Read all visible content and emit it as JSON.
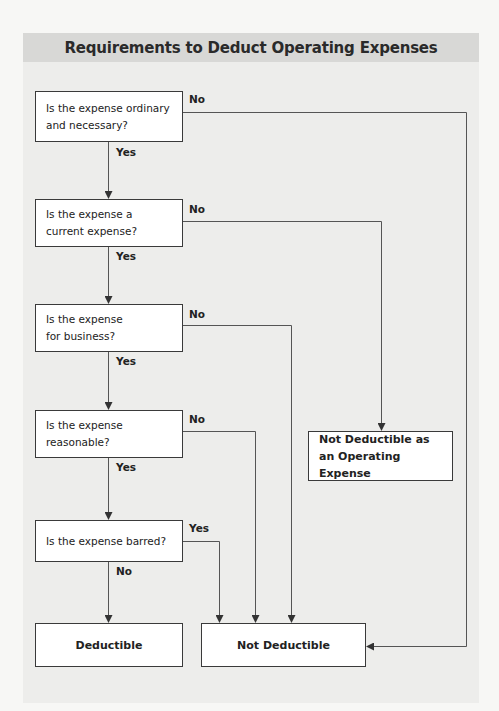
{
  "title": "Requirements to Deduct Operating Expenses",
  "questions": [
    {
      "id": "q1",
      "text": "Is the expense ordinary and necessary?",
      "yes_label": "Yes",
      "no_label": "No"
    },
    {
      "id": "q2",
      "text": "Is the expense a current expense?",
      "yes_label": "Yes",
      "no_label": "No"
    },
    {
      "id": "q3",
      "text": "Is the expense for business?",
      "yes_label": "Yes",
      "no_label": "No"
    },
    {
      "id": "q4",
      "text": "Is the expense reasonable?",
      "yes_label": "Yes",
      "no_label": "No"
    },
    {
      "id": "q5",
      "text": "Is the expense barred?",
      "yes_label": "Yes",
      "no_label": "No"
    }
  ],
  "outcomes": {
    "deductible": "Deductible",
    "not_deductible": "Not Deductible",
    "not_operating": "Not Deductible as an Operating Expense"
  },
  "edges": [
    {
      "from": "q1",
      "label": "Yes",
      "to": "q2"
    },
    {
      "from": "q1",
      "label": "No",
      "to": "not_deductible"
    },
    {
      "from": "q2",
      "label": "Yes",
      "to": "q3"
    },
    {
      "from": "q2",
      "label": "No",
      "to": "not_operating"
    },
    {
      "from": "q3",
      "label": "Yes",
      "to": "q4"
    },
    {
      "from": "q3",
      "label": "No",
      "to": "not_deductible"
    },
    {
      "from": "q4",
      "label": "Yes",
      "to": "q5"
    },
    {
      "from": "q4",
      "label": "No",
      "to": "not_deductible"
    },
    {
      "from": "q5",
      "label": "No",
      "to": "deductible"
    },
    {
      "from": "q5",
      "label": "Yes",
      "to": "not_deductible"
    }
  ]
}
